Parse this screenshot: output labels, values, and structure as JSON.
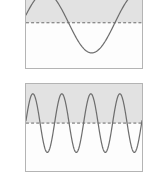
{
  "figure": {
    "title": "",
    "background_color": "#ffffff",
    "panel_border_color": "#b4b4b4",
    "wave_color": "#6e6e6e",
    "midline_color": "#555555",
    "shade_color": "#e2e2e2"
  },
  "panels": [
    {
      "name": "low-frequency-wave-panel",
      "label": "",
      "cycles": 1.25
    },
    {
      "name": "high-frequency-wave-panel",
      "label": "",
      "cycles": 4
    }
  ],
  "chart_data": [
    {
      "type": "line",
      "title": "",
      "subtitle": "",
      "xlabel": "",
      "ylabel": "",
      "xlim": [
        0,
        1.25
      ],
      "ylim": [
        -1.35,
        1.35
      ],
      "grid": false,
      "legend": null,
      "annotations": [
        {
          "name": "midline",
          "type": "hline",
          "y": 0,
          "style": "dashed"
        },
        {
          "name": "shaded-region",
          "type": "hspan",
          "y_from": 0,
          "y_to": 1.35
        }
      ],
      "series": [
        {
          "name": "low-frequency sine",
          "amplitude": 1.0,
          "frequency_cycles": 1.25,
          "phase_deg": 0,
          "waveform": "sine"
        }
      ]
    },
    {
      "type": "line",
      "title": "",
      "subtitle": "",
      "xlabel": "",
      "ylabel": "",
      "xlim": [
        0,
        4
      ],
      "ylim": [
        -1.35,
        1.35
      ],
      "grid": false,
      "legend": null,
      "annotations": [
        {
          "name": "midline",
          "type": "hline",
          "y": 0,
          "style": "dashed"
        },
        {
          "name": "shaded-region",
          "type": "hspan",
          "y_from": 0,
          "y_to": 1.35
        }
      ],
      "series": [
        {
          "name": "high-frequency sine",
          "amplitude": 1.0,
          "frequency_cycles": 4,
          "phase_deg": 0,
          "waveform": "sine"
        }
      ]
    }
  ]
}
